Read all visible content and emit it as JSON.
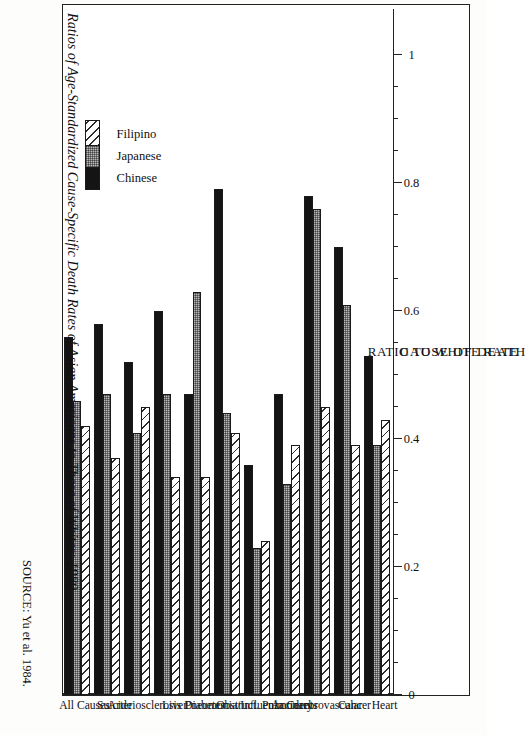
{
  "figure": {
    "title": "Ratios of Age-Standardized Cause-Specific Death Rates of Asian Americans to Those of Whites: 1980",
    "source": "SOURCE: Yu et al. 1984."
  },
  "legend": {
    "items": [
      {
        "label": "Chinese",
        "pattern": "solid-black",
        "color": "#141414"
      },
      {
        "label": "Japanese",
        "pattern": "fine-dotted-gray",
        "color": "#b9b9b9"
      },
      {
        "label": "Filipino",
        "pattern": "diagonal-hatch",
        "color": "#ffffff"
      }
    ]
  },
  "axes": {
    "value_axis_title": "RATIO TO WHITE RATE",
    "category_axis_title": "CAUSE OF DEATH",
    "tick_labels": [
      "1",
      "0.8",
      "0.6",
      "0.4",
      "0.2",
      "0"
    ],
    "tick_values": [
      1,
      0.8,
      0.6,
      0.4,
      0.2,
      0
    ]
  },
  "chart_data": {
    "type": "bar",
    "orientation": "horizontal",
    "title": "Ratios of Age-Standardized Cause-Specific Death Rates of Asian Americans to Those of Whites: 1980",
    "xlabel": "CAUSE OF DEATH",
    "ylabel": "RATIO TO WHITE RATE",
    "ylim": [
      0,
      1
    ],
    "yticks": [
      0,
      0.2,
      0.4,
      0.6,
      0.8,
      1
    ],
    "grid": false,
    "legend_position": "top-left",
    "categories": [
      "Heart",
      "Cancer",
      "Cerebrovascular",
      "Accidents",
      "Obstruct. Pulmonary",
      "Pneumonia/Influenza",
      "Diabetes",
      "Liver",
      "Arteriosclerosis",
      "Suicide",
      "All Causes"
    ],
    "series": [
      {
        "name": "Chinese",
        "values": [
          0.53,
          0.7,
          0.78,
          0.47,
          0.36,
          0.79,
          0.47,
          0.6,
          0.52,
          0.58,
          0.56
        ]
      },
      {
        "name": "Japanese",
        "values": [
          0.39,
          0.61,
          0.76,
          0.33,
          0.23,
          0.44,
          0.63,
          0.47,
          0.41,
          0.47,
          0.46
        ]
      },
      {
        "name": "Filipino",
        "values": [
          0.43,
          0.39,
          0.45,
          0.39,
          0.24,
          0.41,
          0.34,
          0.34,
          0.45,
          0.37,
          0.42
        ]
      }
    ]
  }
}
